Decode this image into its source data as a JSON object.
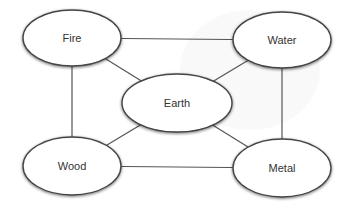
{
  "diagram": {
    "title": "",
    "nodes": [
      {
        "id": "fire",
        "label": "Fire"
      },
      {
        "id": "water",
        "label": "Water"
      },
      {
        "id": "earth",
        "label": "Earth"
      },
      {
        "id": "wood",
        "label": "Wood"
      },
      {
        "id": "metal",
        "label": "Metal"
      }
    ],
    "edges": [
      {
        "from": "fire",
        "to": "water"
      },
      {
        "from": "fire",
        "to": "wood"
      },
      {
        "from": "fire",
        "to": "earth"
      },
      {
        "from": "water",
        "to": "earth"
      },
      {
        "from": "water",
        "to": "metal"
      },
      {
        "from": "wood",
        "to": "earth"
      },
      {
        "from": "wood",
        "to": "metal"
      },
      {
        "from": "metal",
        "to": "earth"
      }
    ]
  }
}
